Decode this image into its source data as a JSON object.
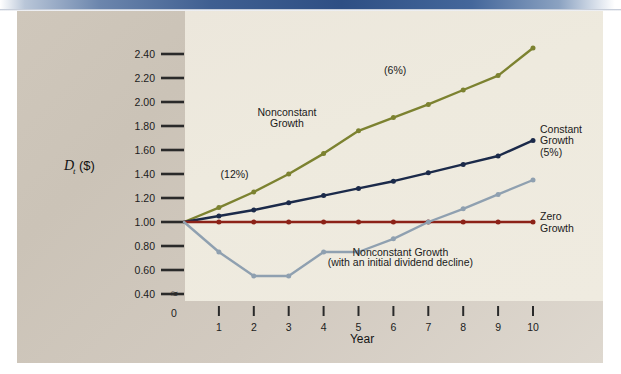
{
  "slide": {
    "banner_color": "#2e4f84",
    "figure_bg_color": "#cfc7bb",
    "plot_panel_color": "#eeeade"
  },
  "chart_data": {
    "type": "line",
    "title": "",
    "xlabel": "Year",
    "ylabel": "D_t ($)",
    "ylabel_parts": {
      "main": "D",
      "sub": "t",
      "paren": "($)"
    },
    "x": [
      0,
      1,
      2,
      3,
      4,
      5,
      6,
      7,
      8,
      9,
      10
    ],
    "xtick_labels": [
      "0",
      "1",
      "2",
      "3",
      "4",
      "5",
      "6",
      "7",
      "8",
      "9",
      "10"
    ],
    "ytick_labels": [
      "2.40",
      "2.20",
      "2.00",
      "1.80",
      "1.60",
      "1.40",
      "1.20",
      "1.00",
      "0.80",
      "0.60",
      "0.40"
    ],
    "ytick_values": [
      2.4,
      2.2,
      2.0,
      1.8,
      1.6,
      1.4,
      1.2,
      1.0,
      0.8,
      0.6,
      0.4
    ],
    "ylim": [
      0.34,
      2.52
    ],
    "xlim": [
      0,
      10
    ],
    "grid": false,
    "axis_break_symbol": "≈",
    "legend_position": "inline-right",
    "series": [
      {
        "name": "Nonconstant Growth",
        "color": "#7c8230",
        "values": [
          1.0,
          1.12,
          1.25,
          1.4,
          1.57,
          1.76,
          1.87,
          1.98,
          2.1,
          2.22,
          2.45
        ]
      },
      {
        "name": "Constant Growth (5%)",
        "color": "#1b2a4a",
        "values": [
          1.0,
          1.05,
          1.1,
          1.16,
          1.22,
          1.28,
          1.34,
          1.41,
          1.48,
          1.55,
          1.68
        ]
      },
      {
        "name": "Zero Growth",
        "color": "#8c2218",
        "values": [
          1.0,
          1.0,
          1.0,
          1.0,
          1.0,
          1.0,
          1.0,
          1.0,
          1.0,
          1.0,
          1.0
        ]
      },
      {
        "name": "Nonconstant Growth (with an initial dividend decline)",
        "color": "#8fa0b0",
        "values": [
          1.0,
          0.75,
          0.55,
          0.55,
          0.75,
          0.75,
          0.86,
          1.0,
          1.11,
          1.23,
          1.35
        ]
      }
    ],
    "annotations": [
      {
        "id": "rate-12",
        "text": "(12%)",
        "x": 1.45,
        "y": 1.37
      },
      {
        "id": "rate-6",
        "text": "(6%)",
        "x": 6.05,
        "y": 2.23
      },
      {
        "id": "nonconstant-growth-label-line1",
        "text": "Nonconstant",
        "x": 2.95,
        "y": 1.88
      },
      {
        "id": "nonconstant-growth-label-line2",
        "text": "Growth",
        "x": 2.95,
        "y": 1.79
      },
      {
        "id": "decline-label-line1",
        "text": "Nonconstant Growth",
        "x": 6.2,
        "y": 0.72
      },
      {
        "id": "decline-label-line2",
        "text": "(with an initial dividend decline)",
        "x": 6.2,
        "y": 0.635
      }
    ],
    "right_labels": [
      {
        "id": "constant-growth",
        "lines": [
          "Constant",
          "Growth",
          "(5%)"
        ],
        "anchor_y": 1.68
      },
      {
        "id": "zero-growth",
        "lines": [
          "Zero",
          "Growth"
        ],
        "anchor_y": 1.0
      }
    ]
  }
}
